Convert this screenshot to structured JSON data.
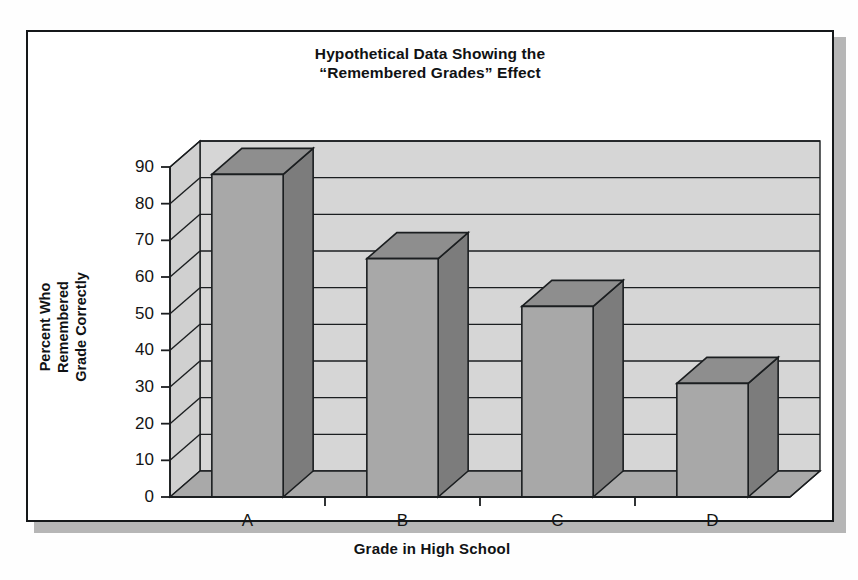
{
  "figure": {
    "title_lines": [
      "Hypothetical Data Showing the",
      "“Remembered Grades” Effect"
    ]
  },
  "chart_data": {
    "type": "bar",
    "title": "Hypothetical Data Showing the “Remembered Grades” Effect",
    "categories": [
      "A",
      "B",
      "C",
      "D"
    ],
    "values": [
      88,
      65,
      52,
      31
    ],
    "xlabel": "Grade in High School",
    "ylabel": "Percent Who Remembered Grade Correctly",
    "ylabel_lines": [
      "Percent Who",
      "Remembered",
      "Grade Correctly"
    ],
    "ylim": [
      0,
      90
    ],
    "yticks": [
      0,
      10,
      20,
      30,
      40,
      50,
      60,
      70,
      80,
      90
    ],
    "ytick_labels": [
      "0",
      "10",
      "20",
      "30",
      "40",
      "50",
      "60",
      "70",
      "80",
      "90"
    ],
    "grid": true,
    "grid_axis": "y",
    "legend": null,
    "style": "3d-column",
    "colors": {
      "bar_front": "#a8a8a8",
      "bar_top": "#8e8e8e",
      "bar_side": "#7c7c7c",
      "wall_back": "#d6d6d6",
      "wall_side": "#d0d0d0",
      "floor": "#a9a9a9",
      "outline": "#1b1e20",
      "text": "#101214",
      "frame": "#15181a",
      "background": "#ffffff"
    }
  }
}
